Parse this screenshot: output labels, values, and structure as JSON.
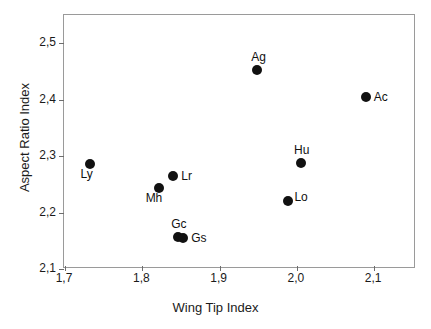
{
  "chart_data": {
    "type": "scatter",
    "title": "",
    "xlabel": "Wing Tip Index",
    "ylabel": "Aspect Ratio Index",
    "xlim": [
      1.66,
      2.126
    ],
    "ylim": [
      2.1,
      2.55
    ],
    "xticks": [
      "1,7",
      "1,8",
      "1,9",
      "2,0",
      "2,1"
    ],
    "xtick_values": [
      1.7,
      1.8,
      1.9,
      2.0,
      2.1
    ],
    "yticks": [
      "2,1",
      "2,2",
      "2,3",
      "2,4",
      "2,5"
    ],
    "ytick_values": [
      2.1,
      2.2,
      2.3,
      2.4,
      2.5
    ],
    "grid": false,
    "legend": "none",
    "decimal_separator": ",",
    "marker_color": "#111111",
    "frame_color": "#9a9a9a",
    "points": [
      {
        "label": "Ly",
        "x": 1.732,
        "y": 2.286,
        "label_pos": "below-left"
      },
      {
        "label": "Mh",
        "x": 1.822,
        "y": 2.243,
        "label_pos": "below-left"
      },
      {
        "label": "Lr",
        "x": 1.84,
        "y": 2.265,
        "label_pos": "right"
      },
      {
        "label": "Gc",
        "x": 1.846,
        "y": 2.156,
        "label_pos": "above"
      },
      {
        "label": "Gs",
        "x": 1.853,
        "y": 2.154,
        "label_pos": "right"
      },
      {
        "label": "Ag",
        "x": 1.949,
        "y": 2.453,
        "label_pos": "above"
      },
      {
        "label": "Lo",
        "x": 1.989,
        "y": 2.22,
        "label_pos": "up-right"
      },
      {
        "label": "Hu",
        "x": 2.005,
        "y": 2.288,
        "label_pos": "above"
      },
      {
        "label": "Ac",
        "x": 2.089,
        "y": 2.404,
        "label_pos": "right"
      }
    ]
  }
}
